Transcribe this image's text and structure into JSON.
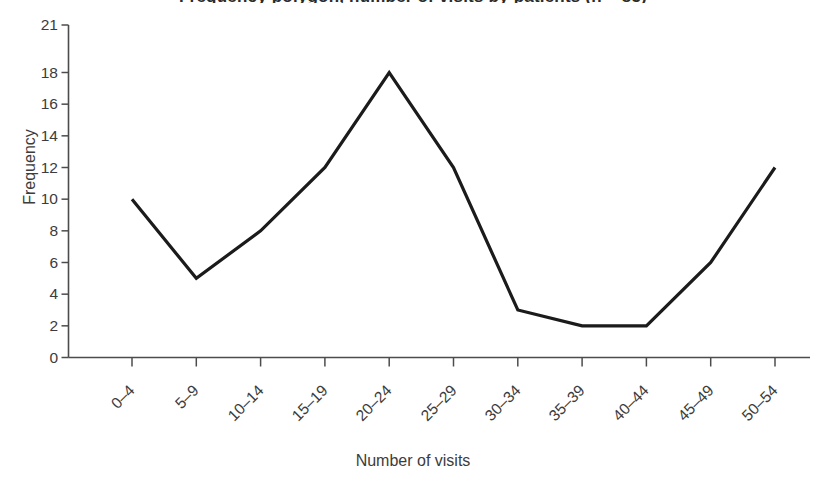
{
  "chart_data": {
    "type": "line",
    "title": "Frequency polygon, number of visits by patients (n = 85)",
    "xlabel": "Number of visits",
    "ylabel": "Frequency",
    "categories": [
      "0–4",
      "5–9",
      "10–14",
      "15–19",
      "20–24",
      "25–29",
      "30–34",
      "35–39",
      "40–44",
      "45–49",
      "50–54"
    ],
    "values": [
      10,
      5,
      8,
      12,
      18,
      12,
      3,
      2,
      2,
      6,
      12
    ],
    "ylim": [
      0,
      21
    ],
    "yticks": [
      0,
      2,
      4,
      6,
      8,
      10,
      12,
      14,
      16,
      18,
      21
    ],
    "ytick_labels": [
      "0",
      "2",
      "4",
      "6",
      "8",
      "10",
      "12",
      "14",
      "16",
      "18",
      "21"
    ],
    "grid": false,
    "legend": false,
    "legend_position": "none",
    "series": [
      {
        "name": "Frequency",
        "color": "#1b1b1b",
        "values": [
          10,
          5,
          8,
          12,
          18,
          12,
          3,
          2,
          2,
          6,
          12
        ]
      }
    ],
    "annotations": []
  },
  "style": {
    "line_color": "#1b1b1b",
    "axis_color": "#4c4c4c",
    "text_color": "#3c3c3c",
    "background": "#ffffff"
  }
}
